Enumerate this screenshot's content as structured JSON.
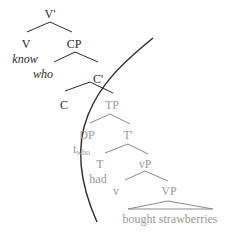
{
  "diagram": {
    "type": "syntax-tree",
    "colors": {
      "dark": "#2a2a2a",
      "gray": "#9a9a9a",
      "boundary": "#2a2a2a"
    },
    "nodes": {
      "vbar": "V'",
      "v": "V",
      "cp": "CP",
      "know": "know",
      "who": "who",
      "cbar": "C'",
      "c": "C",
      "tp": "TP",
      "dp": "DP",
      "tbar": "T'",
      "trace": "t",
      "trace_sub": "who",
      "t": "T",
      "had": "had",
      "littlevp": "vP",
      "littlev": "v",
      "vp": "VP",
      "vp_content": "bought strawberries"
    }
  }
}
